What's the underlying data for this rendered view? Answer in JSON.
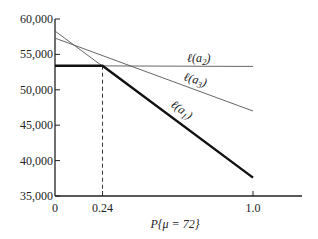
{
  "chart_data": {
    "type": "line",
    "title": "",
    "xlabel": "P{μ = 72}",
    "ylabel": "",
    "xlim": [
      0,
      1.0
    ],
    "ylim": [
      35000,
      60000
    ],
    "x_ticks": [
      {
        "value": 0,
        "label": "0"
      },
      {
        "value": 0.24,
        "label": "0.24"
      },
      {
        "value": 1.0,
        "label": "1.0"
      }
    ],
    "y_ticks": [
      {
        "value": 60000,
        "label": "60,000"
      },
      {
        "value": 55000,
        "label": "55,000"
      },
      {
        "value": 50000,
        "label": "50,000"
      },
      {
        "value": 45000,
        "label": "45,000"
      },
      {
        "value": 40000,
        "label": "40,000"
      },
      {
        "value": 35000,
        "label": "35,000"
      }
    ],
    "grid": false,
    "legend": "inline labels",
    "series": [
      {
        "name": "ℓ(a1)",
        "label_base": "ℓ(a",
        "label_sub": "1",
        "label_end": ")",
        "x": [
          0,
          1.0
        ],
        "values": [
          58300,
          37600
        ],
        "style": "thin"
      },
      {
        "name": "ℓ(a2)",
        "label_base": "ℓ(a",
        "label_sub": "2",
        "label_end": ")",
        "x": [
          0,
          1.0
        ],
        "values": [
          53400,
          53300
        ],
        "style": "thin"
      },
      {
        "name": "ℓ(a3)",
        "label_base": "ℓ(a",
        "label_sub": "3",
        "label_end": ")",
        "x": [
          0,
          1.0
        ],
        "values": [
          57300,
          47000
        ],
        "style": "thin"
      }
    ],
    "envelope": {
      "name": "optimal (bold)",
      "x": [
        0,
        0.24,
        1.0
      ],
      "values": [
        53400,
        53400,
        37600
      ]
    },
    "annotations": [
      {
        "type": "dashed-vertical",
        "x": 0.24,
        "from": 35000,
        "to": 53400
      }
    ]
  }
}
